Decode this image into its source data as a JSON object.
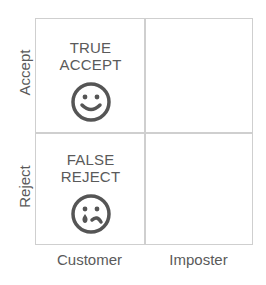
{
  "diagram": {
    "rows": [
      {
        "label": "Accept"
      },
      {
        "label": "Reject"
      }
    ],
    "columns": [
      {
        "label": "Customer"
      },
      {
        "label": "Imposter"
      }
    ],
    "cells": {
      "accept_customer": {
        "line1": "TRUE",
        "line2": "ACCEPT",
        "icon": "happy-face-icon"
      },
      "reject_customer": {
        "line1": "FALSE",
        "line2": "REJECT",
        "icon": "crying-face-icon"
      },
      "accept_imposter": {
        "line1": "",
        "line2": ""
      },
      "reject_imposter": {
        "line1": "",
        "line2": ""
      }
    },
    "colors": {
      "grid": "#cfcfcf",
      "text": "#5a5a5a",
      "icon": "#555555"
    }
  }
}
